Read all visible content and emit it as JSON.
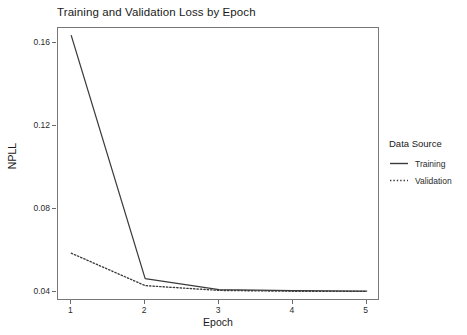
{
  "chart_data": {
    "type": "line",
    "title": "Training and Validation Loss by Epoch",
    "xlabel": "Epoch",
    "ylabel": "NPLL",
    "x": [
      1,
      2,
      3,
      4,
      5
    ],
    "xticklabels": [
      "1",
      "2",
      "3",
      "4",
      "5"
    ],
    "yticklabels": [
      "0.04",
      "0.08",
      "0.12",
      "0.16"
    ],
    "yticks": [
      0.04,
      0.08,
      0.12,
      0.16
    ],
    "xlim": [
      0.82,
      5.18
    ],
    "ylim": [
      0.0358,
      0.1672
    ],
    "grid": false,
    "legend_position": "right",
    "legend_title": "Data Source",
    "series": [
      {
        "name": "Training",
        "style": "solid",
        "color": "#3b3b3b",
        "values": [
          0.1635,
          0.0466,
          0.0413,
          0.0408,
          0.0406
        ]
      },
      {
        "name": "Validation",
        "style": "dotted",
        "color": "#3b3b3b",
        "values": [
          0.0588,
          0.0432,
          0.0409,
          0.0405,
          0.0404
        ]
      }
    ]
  },
  "legend": {
    "title": "Data Source",
    "items": [
      {
        "label": "Training",
        "style": "solid"
      },
      {
        "label": "Validation",
        "style": "dotted"
      }
    ]
  }
}
